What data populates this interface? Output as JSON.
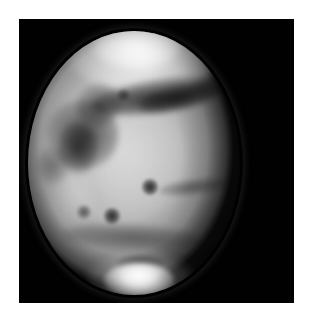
{
  "page": {
    "background_color": "#ffffff",
    "width": 314,
    "height": 324
  },
  "image_panel": {
    "name": "mars-telescopic-image",
    "background_color": "#000000",
    "subject": "Mars",
    "rendering": "grayscale",
    "left": 19,
    "top": 19,
    "width": 275,
    "height": 284
  },
  "planet": {
    "name": "Mars",
    "disk_center_x": 148,
    "disk_center_y": 165,
    "disk_radius_px": 102,
    "illumination": "gibbous, terminator on right limb",
    "base_color": "#b8b8b8",
    "shadow_color": "#000000",
    "highlight_color": "#ffffff"
  },
  "features": [
    {
      "id": "north-polar-hood",
      "label": "bright north limb hood",
      "tone": "bright"
    },
    {
      "id": "north-dark-belt",
      "label": "dark band below north hood",
      "tone": "dark"
    },
    {
      "id": "left-albedo-complex",
      "label": "dark albedo markings, left hemisphere",
      "tone": "dark"
    },
    {
      "id": "central-bright-plain",
      "label": "bright central plains",
      "tone": "bright"
    },
    {
      "id": "dark-spot-center-right",
      "label": "small dark spot",
      "tone": "dark"
    },
    {
      "id": "dark-spot-lower-center",
      "label": "small dark spot",
      "tone": "dark"
    },
    {
      "id": "right-limb-streak",
      "label": "dark streak toward right limb",
      "tone": "dark"
    },
    {
      "id": "south-dark-band",
      "label": "dark band above south polar cap",
      "tone": "dark"
    },
    {
      "id": "south-polar-cap",
      "label": "bright south polar cap",
      "tone": "bright"
    }
  ],
  "caption": {
    "text": "",
    "state": "clipped at page edge, glyph tops only, illegible"
  }
}
